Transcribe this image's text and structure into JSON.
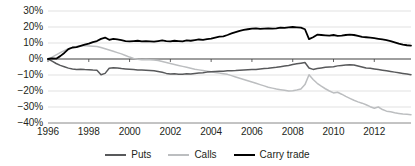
{
  "chart_data": {
    "type": "line",
    "title": "",
    "xlabel": "",
    "ylabel": "",
    "xlim": [
      1996.0,
      2013.8
    ],
    "ylim": [
      -0.4,
      0.3
    ],
    "grid": true,
    "grid_axis": "y",
    "legend_position": "bottom",
    "y_ticks": [
      0.3,
      0.2,
      0.1,
      0.0,
      -0.1,
      -0.2,
      -0.3,
      -0.4
    ],
    "y_tick_labels": [
      "30%",
      "20%",
      "10%",
      "0%",
      "-10%",
      "-20%",
      "-30%",
      "-40%"
    ],
    "x_ticks": [
      1996,
      1998,
      2000,
      2002,
      2004,
      2006,
      2008,
      2010,
      2012
    ],
    "x_tick_labels": [
      "1996",
      "1998",
      "2000",
      "2002",
      "2004",
      "2006",
      "2008",
      "2010",
      "2012"
    ],
    "zero_line": 0.0,
    "series": [
      {
        "name": "Puts",
        "color": "#58595b",
        "width": 1.5,
        "x": [
          1996.0,
          1996.2,
          1996.4,
          1996.6,
          1996.8,
          1997.0,
          1997.2,
          1997.4,
          1997.6,
          1997.8,
          1998.0,
          1998.2,
          1998.4,
          1998.6,
          1998.8,
          1999.0,
          1999.2,
          1999.4,
          1999.6,
          1999.8,
          2000.0,
          2000.2,
          2000.4,
          2000.6,
          2000.8,
          2001.0,
          2001.2,
          2001.4,
          2001.6,
          2001.8,
          2002.0,
          2002.2,
          2002.4,
          2002.6,
          2002.8,
          2003.0,
          2003.2,
          2003.4,
          2003.6,
          2003.8,
          2004.0,
          2004.2,
          2004.4,
          2004.6,
          2004.8,
          2005.0,
          2005.2,
          2005.4,
          2005.6,
          2005.8,
          2006.0,
          2006.2,
          2006.4,
          2006.6,
          2006.8,
          2007.0,
          2007.2,
          2007.4,
          2007.6,
          2007.8,
          2008.0,
          2008.2,
          2008.4,
          2008.6,
          2008.8,
          2009.0,
          2009.2,
          2009.4,
          2009.6,
          2009.8,
          2010.0,
          2010.2,
          2010.4,
          2010.6,
          2010.8,
          2011.0,
          2011.2,
          2011.4,
          2011.6,
          2011.8,
          2012.0,
          2012.2,
          2012.4,
          2012.6,
          2012.8,
          2013.0,
          2013.2,
          2013.4,
          2013.6,
          2013.8
        ],
        "values": [
          0.0,
          -0.013,
          -0.028,
          -0.04,
          -0.048,
          -0.057,
          -0.062,
          -0.065,
          -0.064,
          -0.066,
          -0.067,
          -0.069,
          -0.07,
          -0.098,
          -0.09,
          -0.058,
          -0.055,
          -0.056,
          -0.06,
          -0.062,
          -0.064,
          -0.066,
          -0.068,
          -0.069,
          -0.07,
          -0.072,
          -0.074,
          -0.078,
          -0.083,
          -0.09,
          -0.094,
          -0.092,
          -0.095,
          -0.096,
          -0.092,
          -0.094,
          -0.09,
          -0.088,
          -0.086,
          -0.082,
          -0.08,
          -0.078,
          -0.077,
          -0.076,
          -0.074,
          -0.073,
          -0.072,
          -0.07,
          -0.068,
          -0.067,
          -0.066,
          -0.065,
          -0.062,
          -0.06,
          -0.058,
          -0.055,
          -0.052,
          -0.048,
          -0.044,
          -0.04,
          -0.034,
          -0.03,
          -0.026,
          -0.022,
          -0.056,
          -0.065,
          -0.06,
          -0.056,
          -0.052,
          -0.05,
          -0.048,
          -0.043,
          -0.04,
          -0.038,
          -0.036,
          -0.038,
          -0.044,
          -0.05,
          -0.056,
          -0.058,
          -0.062,
          -0.066,
          -0.07,
          -0.074,
          -0.078,
          -0.082,
          -0.086,
          -0.09,
          -0.094,
          -0.098
        ]
      },
      {
        "name": "Calls",
        "color": "#bcbec0",
        "width": 1.5,
        "x": [
          1996.0,
          1996.2,
          1996.4,
          1996.6,
          1996.8,
          1997.0,
          1997.2,
          1997.4,
          1997.6,
          1997.8,
          1998.0,
          1998.2,
          1998.4,
          1998.6,
          1998.8,
          1999.0,
          1999.2,
          1999.4,
          1999.6,
          1999.8,
          2000.0,
          2000.2,
          2000.4,
          2000.6,
          2000.8,
          2001.0,
          2001.2,
          2001.4,
          2001.6,
          2001.8,
          2002.0,
          2002.2,
          2002.4,
          2002.6,
          2002.8,
          2003.0,
          2003.2,
          2003.4,
          2003.6,
          2003.8,
          2004.0,
          2004.2,
          2004.4,
          2004.6,
          2004.8,
          2005.0,
          2005.2,
          2005.4,
          2005.6,
          2005.8,
          2006.0,
          2006.2,
          2006.4,
          2006.6,
          2006.8,
          2007.0,
          2007.2,
          2007.4,
          2007.6,
          2007.8,
          2008.0,
          2008.2,
          2008.4,
          2008.6,
          2008.8,
          2009.0,
          2009.2,
          2009.4,
          2009.6,
          2009.8,
          2010.0,
          2010.2,
          2010.4,
          2010.6,
          2010.8,
          2011.0,
          2011.2,
          2011.4,
          2011.6,
          2011.8,
          2012.0,
          2012.2,
          2012.4,
          2012.6,
          2012.8,
          2013.0,
          2013.2,
          2013.4,
          2013.6,
          2013.8
        ],
        "values": [
          0.0,
          0.012,
          0.026,
          0.04,
          0.052,
          0.064,
          0.072,
          0.078,
          0.082,
          0.084,
          0.082,
          0.08,
          0.078,
          0.072,
          0.064,
          0.056,
          0.048,
          0.04,
          0.032,
          0.022,
          0.012,
          0.004,
          -0.002,
          -0.004,
          -0.003,
          -0.004,
          -0.006,
          -0.01,
          -0.016,
          -0.022,
          -0.028,
          -0.034,
          -0.04,
          -0.046,
          -0.052,
          -0.058,
          -0.064,
          -0.068,
          -0.072,
          -0.076,
          -0.08,
          -0.084,
          -0.088,
          -0.092,
          -0.096,
          -0.104,
          -0.112,
          -0.12,
          -0.128,
          -0.136,
          -0.144,
          -0.152,
          -0.16,
          -0.168,
          -0.176,
          -0.182,
          -0.188,
          -0.192,
          -0.196,
          -0.2,
          -0.198,
          -0.194,
          -0.188,
          -0.16,
          -0.098,
          -0.128,
          -0.152,
          -0.17,
          -0.186,
          -0.2,
          -0.212,
          -0.208,
          -0.22,
          -0.234,
          -0.246,
          -0.258,
          -0.268,
          -0.276,
          -0.286,
          -0.298,
          -0.308,
          -0.3,
          -0.316,
          -0.326,
          -0.33,
          -0.336,
          -0.34,
          -0.344,
          -0.346,
          -0.348
        ]
      },
      {
        "name": "Carry trade",
        "color": "#000000",
        "width": 1.8,
        "x": [
          1996.0,
          1996.2,
          1996.4,
          1996.6,
          1996.8,
          1997.0,
          1997.2,
          1997.4,
          1997.6,
          1997.8,
          1998.0,
          1998.2,
          1998.4,
          1998.6,
          1998.8,
          1999.0,
          1999.2,
          1999.4,
          1999.6,
          1999.8,
          2000.0,
          2000.2,
          2000.4,
          2000.6,
          2000.8,
          2001.0,
          2001.2,
          2001.4,
          2001.6,
          2001.8,
          2002.0,
          2002.2,
          2002.4,
          2002.6,
          2002.8,
          2003.0,
          2003.2,
          2003.4,
          2003.6,
          2003.8,
          2004.0,
          2004.2,
          2004.4,
          2004.6,
          2004.8,
          2005.0,
          2005.2,
          2005.4,
          2005.6,
          2005.8,
          2006.0,
          2006.2,
          2006.4,
          2006.6,
          2006.8,
          2007.0,
          2007.2,
          2007.4,
          2007.6,
          2007.8,
          2008.0,
          2008.2,
          2008.4,
          2008.6,
          2008.8,
          2009.0,
          2009.2,
          2009.4,
          2009.6,
          2009.8,
          2010.0,
          2010.2,
          2010.4,
          2010.6,
          2010.8,
          2011.0,
          2011.2,
          2011.4,
          2011.6,
          2011.8,
          2012.0,
          2012.2,
          2012.4,
          2012.6,
          2012.8,
          2013.0,
          2013.2,
          2013.4,
          2013.6,
          2013.8
        ],
        "values": [
          0.0,
          0.004,
          0.002,
          0.018,
          0.038,
          0.062,
          0.072,
          0.074,
          0.082,
          0.09,
          0.096,
          0.106,
          0.112,
          0.126,
          0.134,
          0.12,
          0.126,
          0.122,
          0.118,
          0.112,
          0.11,
          0.112,
          0.114,
          0.11,
          0.112,
          0.11,
          0.108,
          0.112,
          0.116,
          0.112,
          0.11,
          0.114,
          0.112,
          0.11,
          0.116,
          0.114,
          0.118,
          0.122,
          0.12,
          0.124,
          0.128,
          0.134,
          0.14,
          0.142,
          0.15,
          0.16,
          0.168,
          0.176,
          0.182,
          0.186,
          0.19,
          0.192,
          0.188,
          0.19,
          0.192,
          0.19,
          0.192,
          0.196,
          0.194,
          0.198,
          0.2,
          0.198,
          0.196,
          0.186,
          0.124,
          0.136,
          0.152,
          0.15,
          0.148,
          0.146,
          0.15,
          0.144,
          0.146,
          0.15,
          0.152,
          0.15,
          0.144,
          0.138,
          0.136,
          0.134,
          0.13,
          0.126,
          0.122,
          0.118,
          0.112,
          0.104,
          0.096,
          0.09,
          0.086,
          0.084
        ]
      }
    ]
  },
  "legend": {
    "items": [
      {
        "label": "Puts",
        "color": "#58595b",
        "width": 2
      },
      {
        "label": "Calls",
        "color": "#bcbec0",
        "width": 2
      },
      {
        "label": "Carry trade",
        "color": "#000000",
        "width": 2.6
      }
    ]
  },
  "style": {
    "grid_color": "#d9d9d9",
    "zero_line_color": "#3f3f3f",
    "axis_color": "#808080",
    "text_color": "#231f20",
    "background": "#ffffff"
  }
}
